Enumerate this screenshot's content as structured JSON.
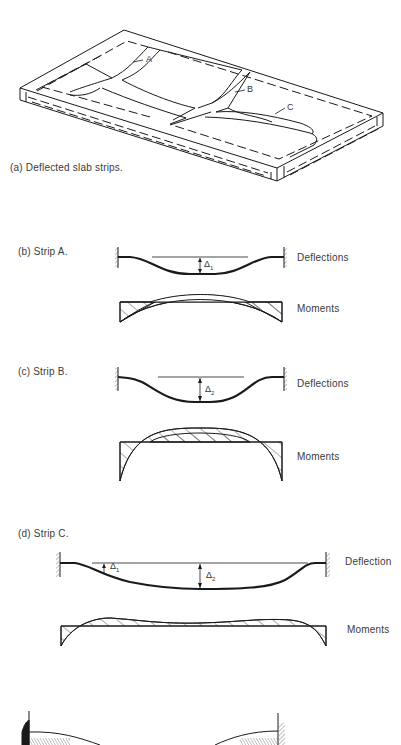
{
  "figure": {
    "panels": [
      {
        "id": "a",
        "caption": "(a)  Deflected slab strips.",
        "strip_labels": [
          "A",
          "B",
          "C"
        ]
      },
      {
        "id": "b",
        "caption": "(b)  Strip A.",
        "deflection_label": "Deflections",
        "moment_label": "Moments",
        "symbols": [
          {
            "base": "Δ",
            "sub": "1"
          }
        ]
      },
      {
        "id": "c",
        "caption": "(c)  Strip B.",
        "deflection_label": "Deflections",
        "moment_label": "Moments",
        "symbols": [
          {
            "base": "Δ",
            "sub": "2"
          }
        ]
      },
      {
        "id": "d",
        "caption": "(d)  Strip C.",
        "deflection_label": "Deflection",
        "moment_label": "Moments",
        "symbols": [
          {
            "base": "Δ",
            "sub": "1"
          },
          {
            "base": "Δ",
            "sub": "2"
          }
        ]
      }
    ],
    "colors": {
      "line": "#1a1a1a",
      "text": "#3a3a3a",
      "background": "#ffffff"
    }
  }
}
